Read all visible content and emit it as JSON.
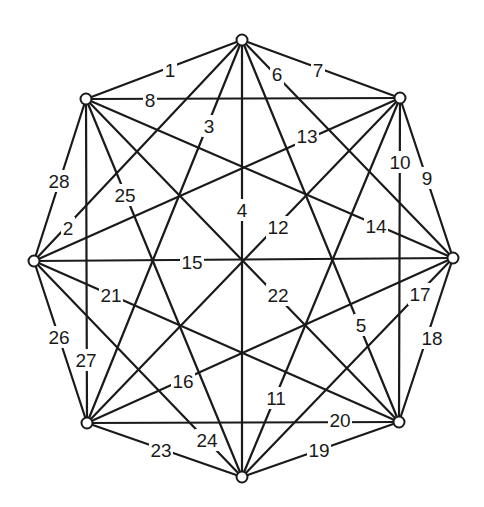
{
  "diagram": {
    "title": "",
    "type": "complete-graph-K8",
    "colors": {
      "line": "#1a1a1a",
      "vertex_fill": "#ffffff",
      "background": "#ffffff"
    },
    "vertices": [
      {
        "id": "T",
        "x": 242,
        "y": 40
      },
      {
        "id": "UR",
        "x": 400,
        "y": 98
      },
      {
        "id": "R",
        "x": 453,
        "y": 258
      },
      {
        "id": "LR",
        "x": 399,
        "y": 422
      },
      {
        "id": "B",
        "x": 242,
        "y": 477
      },
      {
        "id": "LL",
        "x": 87,
        "y": 423
      },
      {
        "id": "L",
        "x": 34,
        "y": 261
      },
      {
        "id": "UL",
        "x": 86,
        "y": 99
      }
    ],
    "edges": [
      {
        "label": "1",
        "from": "T",
        "to": "UL",
        "lx": 170,
        "ly": 70
      },
      {
        "label": "2",
        "from": "L",
        "to": "T",
        "lx": 68,
        "ly": 228
      },
      {
        "label": "3",
        "from": "T",
        "to": "LL",
        "lx": 209,
        "ly": 126
      },
      {
        "label": "4",
        "from": "T",
        "to": "B",
        "lx": 242,
        "ly": 210
      },
      {
        "label": "5",
        "from": "T",
        "to": "LR",
        "lx": 361,
        "ly": 325
      },
      {
        "label": "6",
        "from": "T",
        "to": "R",
        "lx": 277,
        "ly": 74
      },
      {
        "label": "7",
        "from": "T",
        "to": "UR",
        "lx": 318,
        "ly": 70
      },
      {
        "label": "8",
        "from": "UL",
        "to": "UR",
        "lx": 150,
        "ly": 100
      },
      {
        "label": "9",
        "from": "UR",
        "to": "R",
        "lx": 427,
        "ly": 178
      },
      {
        "label": "10",
        "from": "UR",
        "to": "LR",
        "lx": 400,
        "ly": 162
      },
      {
        "label": "11",
        "from": "UR",
        "to": "B",
        "lx": 276,
        "ly": 398
      },
      {
        "label": "12",
        "from": "UR",
        "to": "LL",
        "lx": 278,
        "ly": 227
      },
      {
        "label": "13",
        "from": "UR",
        "to": "L",
        "lx": 307,
        "ly": 136
      },
      {
        "label": "14",
        "from": "UL",
        "to": "R",
        "lx": 376,
        "ly": 226
      },
      {
        "label": "15",
        "from": "L",
        "to": "R",
        "lx": 192,
        "ly": 262
      },
      {
        "label": "16",
        "from": "R",
        "to": "LL",
        "lx": 183,
        "ly": 381
      },
      {
        "label": "17",
        "from": "R",
        "to": "B",
        "lx": 420,
        "ly": 294
      },
      {
        "label": "18",
        "from": "R",
        "to": "LR",
        "lx": 432,
        "ly": 338
      },
      {
        "label": "19",
        "from": "LR",
        "to": "B",
        "lx": 319,
        "ly": 450
      },
      {
        "label": "20",
        "from": "LL",
        "to": "LR",
        "lx": 340,
        "ly": 420
      },
      {
        "label": "21",
        "from": "L",
        "to": "LR",
        "lx": 111,
        "ly": 295
      },
      {
        "label": "22",
        "from": "UL",
        "to": "LR",
        "lx": 278,
        "ly": 295
      },
      {
        "label": "23",
        "from": "B",
        "to": "LL",
        "lx": 161,
        "ly": 450
      },
      {
        "label": "24",
        "from": "L",
        "to": "B",
        "lx": 207,
        "ly": 440
      },
      {
        "label": "25",
        "from": "UL",
        "to": "B",
        "lx": 125,
        "ly": 195
      },
      {
        "label": "26",
        "from": "LL",
        "to": "L",
        "lx": 59,
        "ly": 337
      },
      {
        "label": "27",
        "from": "UL",
        "to": "LL",
        "lx": 86,
        "ly": 360
      },
      {
        "label": "28",
        "from": "L",
        "to": "UL",
        "lx": 59,
        "ly": 181
      }
    ]
  }
}
